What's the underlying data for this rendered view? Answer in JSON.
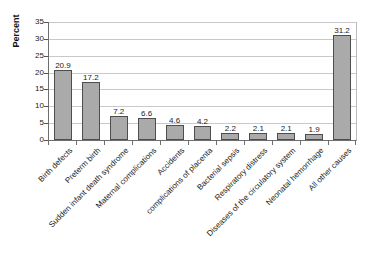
{
  "chart_data": {
    "type": "bar",
    "title": "",
    "subtitle": "",
    "xlabel": "",
    "ylabel": "Percent",
    "ylim": [
      0,
      35
    ],
    "ytick_step": 5,
    "yticks": [
      0,
      5,
      10,
      15,
      20,
      25,
      30,
      35
    ],
    "grid": true,
    "legend": "none",
    "orientation": "vertical",
    "categories": [
      "Birth defects",
      "Preterm birth",
      "Sudden infant death syndrome",
      "Maternal complications",
      "Accidents",
      "complications of placenta",
      "Bacterial sepsis",
      "Respiratory distress",
      "Diseases of the circulatory system",
      "Neonatal hemorrhage",
      "All other causes"
    ],
    "values": [
      20.9,
      17.2,
      7.2,
      6.6,
      4.6,
      4.2,
      2.2,
      2.1,
      2.1,
      1.9,
      31.2
    ],
    "value_labels": [
      "20.9",
      "17.2",
      "7.2",
      "6.6",
      "4.6",
      "4.2",
      "2.2",
      "2.1",
      "2.1",
      "1.9",
      "31.2"
    ],
    "bar_color": "#aaaaaa",
    "bar_border_color": "#4d4d4d",
    "gridline_color": "#c9c9c9",
    "axis_color": "#6e6e6e",
    "text_color": "#1a1a1a",
    "background": "#ffffff"
  }
}
